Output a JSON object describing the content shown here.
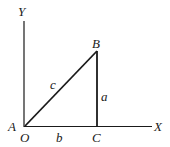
{
  "diagram": {
    "type": "right-triangle-on-axes",
    "axes": {
      "x_label": "X",
      "y_label": "Y",
      "origin_label": "O"
    },
    "vertices": {
      "A": "A",
      "B": "B",
      "C": "C"
    },
    "sides": {
      "hypotenuse": "c",
      "vertical": "a",
      "base": "b"
    },
    "colors": {
      "line": "#1a1a1a",
      "background": "#ffffff"
    }
  }
}
